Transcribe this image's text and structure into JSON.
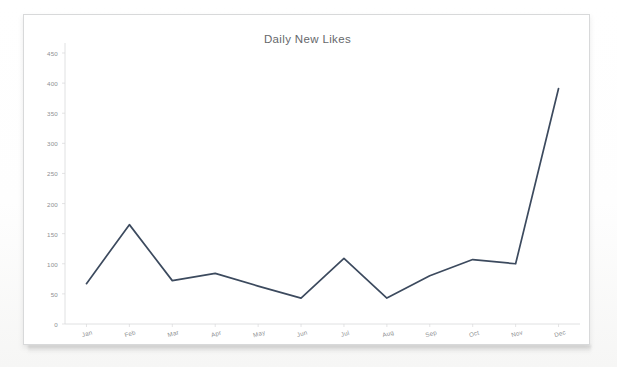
{
  "chart_data": {
    "type": "line",
    "title": "Daily New Likes",
    "xlabel": "",
    "ylabel": "",
    "categories": [
      "Jan",
      "Feb",
      "Mar",
      "Apr",
      "May",
      "Jun",
      "Jul",
      "Aug",
      "Sep",
      "Oct",
      "Nov",
      "Dec"
    ],
    "values": [
      67,
      165,
      72,
      84,
      63,
      43,
      109,
      43,
      80,
      107,
      100,
      391
    ],
    "series": [
      {
        "name": "Daily New Likes",
        "values": [
          67,
          165,
          72,
          84,
          63,
          43,
          109,
          43,
          80,
          107,
          100,
          391
        ],
        "color": "#3c4a5e"
      }
    ],
    "ylim": [
      0,
      450
    ],
    "yticks": [
      0,
      50,
      100,
      150,
      200,
      250,
      300,
      350,
      400,
      450
    ],
    "ytick_labels": [
      "0",
      "50",
      "100",
      "150",
      "200",
      "250",
      "300",
      "350",
      "400",
      "450"
    ],
    "grid": false,
    "legend": false,
    "legend_position": "none",
    "markers": false,
    "line_color": "#3c4a5e",
    "axis_color": "#d8d9da",
    "tick_label_color": "#8d8f92",
    "title_color": "#66686b",
    "background_color": "#ffffff"
  }
}
